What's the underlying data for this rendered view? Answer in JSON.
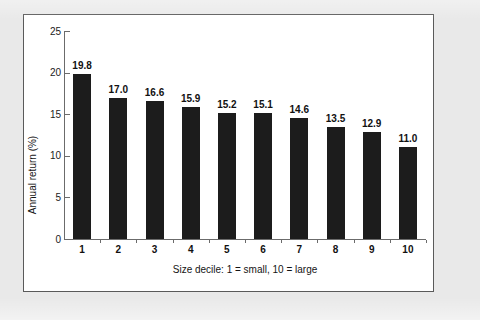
{
  "figure": {
    "background_color": "#e9e9e9",
    "panel_background_color": "#ffffff",
    "panel_border_color": "#5a5a5a"
  },
  "chart_data": {
    "type": "bar",
    "title": "",
    "subtitle": "",
    "xlabel": "Size decile: 1 = small, 10 = large",
    "ylabel": "Annual return (%)",
    "categories": [
      "1",
      "2",
      "3",
      "4",
      "5",
      "6",
      "7",
      "8",
      "9",
      "10"
    ],
    "values": [
      19.8,
      17.0,
      16.6,
      15.9,
      15.2,
      15.1,
      14.6,
      13.5,
      12.9,
      11.0
    ],
    "data_labels": [
      "19.8",
      "17.0",
      "16.6",
      "15.9",
      "15.2",
      "15.1",
      "14.6",
      "13.5",
      "12.9",
      "11.0"
    ],
    "ylim": [
      0,
      25
    ],
    "y_ticks": [
      0,
      5,
      10,
      15,
      20,
      25
    ],
    "y_tick_labels": [
      "0",
      "5",
      "10",
      "15",
      "20",
      "25"
    ],
    "grid": false,
    "legend": null,
    "legend_position": "none",
    "bar_color": "#1c1c1c",
    "axis_color": "#6b6b6b"
  }
}
